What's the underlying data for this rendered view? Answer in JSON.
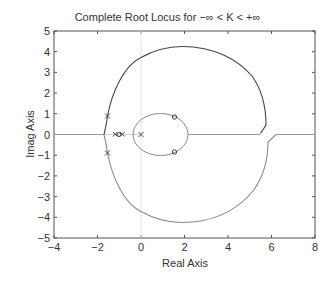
{
  "chart_data": {
    "type": "line",
    "title": "Complete Root Locus for −∞ < K < +∞",
    "xlabel": "Real Axis",
    "ylabel": "Imag Axis",
    "xlim": [
      -4,
      8
    ],
    "ylim": [
      -5,
      5
    ],
    "xticks": [
      -4,
      -2,
      0,
      2,
      4,
      6,
      8
    ],
    "yticks": [
      5,
      4,
      3,
      2,
      1,
      0,
      -1,
      -2,
      -3,
      -4,
      -5
    ],
    "grid": false,
    "poles": [
      [
        -1.55,
        0.9
      ],
      [
        -1.55,
        -0.9
      ],
      [
        -1.4,
        0
      ],
      [
        -1.1,
        0
      ],
      [
        0,
        0
      ]
    ],
    "zeros": [
      [
        1.5,
        0.85
      ],
      [
        1.5,
        -0.85
      ],
      [
        -1.25,
        0
      ]
    ],
    "series": [
      {
        "name": "K>0 upper branch",
        "color": "#444444",
        "points": [
          [
            -1.7,
            0
          ],
          [
            -1.55,
            0.9
          ],
          [
            -1.2,
            2.4
          ],
          [
            -0.3,
            3.7
          ],
          [
            1.9,
            4.25
          ],
          [
            4.2,
            3.5
          ],
          [
            5.4,
            2.0
          ],
          [
            5.75,
            0.45
          ],
          [
            5.5,
            0.05
          ]
        ]
      },
      {
        "name": "K<0 lower branch",
        "color": "#888888",
        "points": [
          [
            -1.7,
            0
          ],
          [
            -1.55,
            -0.9
          ],
          [
            -1.2,
            -2.4
          ],
          [
            -0.3,
            -3.7
          ],
          [
            1.9,
            -4.25
          ],
          [
            4.2,
            -3.5
          ],
          [
            5.5,
            -2.0
          ],
          [
            5.85,
            -0.35
          ],
          [
            6.2,
            0
          ]
        ]
      },
      {
        "name": "inner loop",
        "color": "#888888",
        "points": [
          [
            -0.4,
            0
          ],
          [
            0.85,
            1.0
          ],
          [
            2.1,
            0
          ],
          [
            0.85,
            -1.0
          ]
        ]
      },
      {
        "name": "real axis segments",
        "color": "#999999",
        "points": [
          [
            -4,
            0
          ],
          [
            -1.7,
            0
          ],
          [
            0,
            0
          ],
          [
            5.5,
            0
          ],
          [
            6.2,
            0
          ],
          [
            8,
            0
          ]
        ]
      }
    ]
  }
}
